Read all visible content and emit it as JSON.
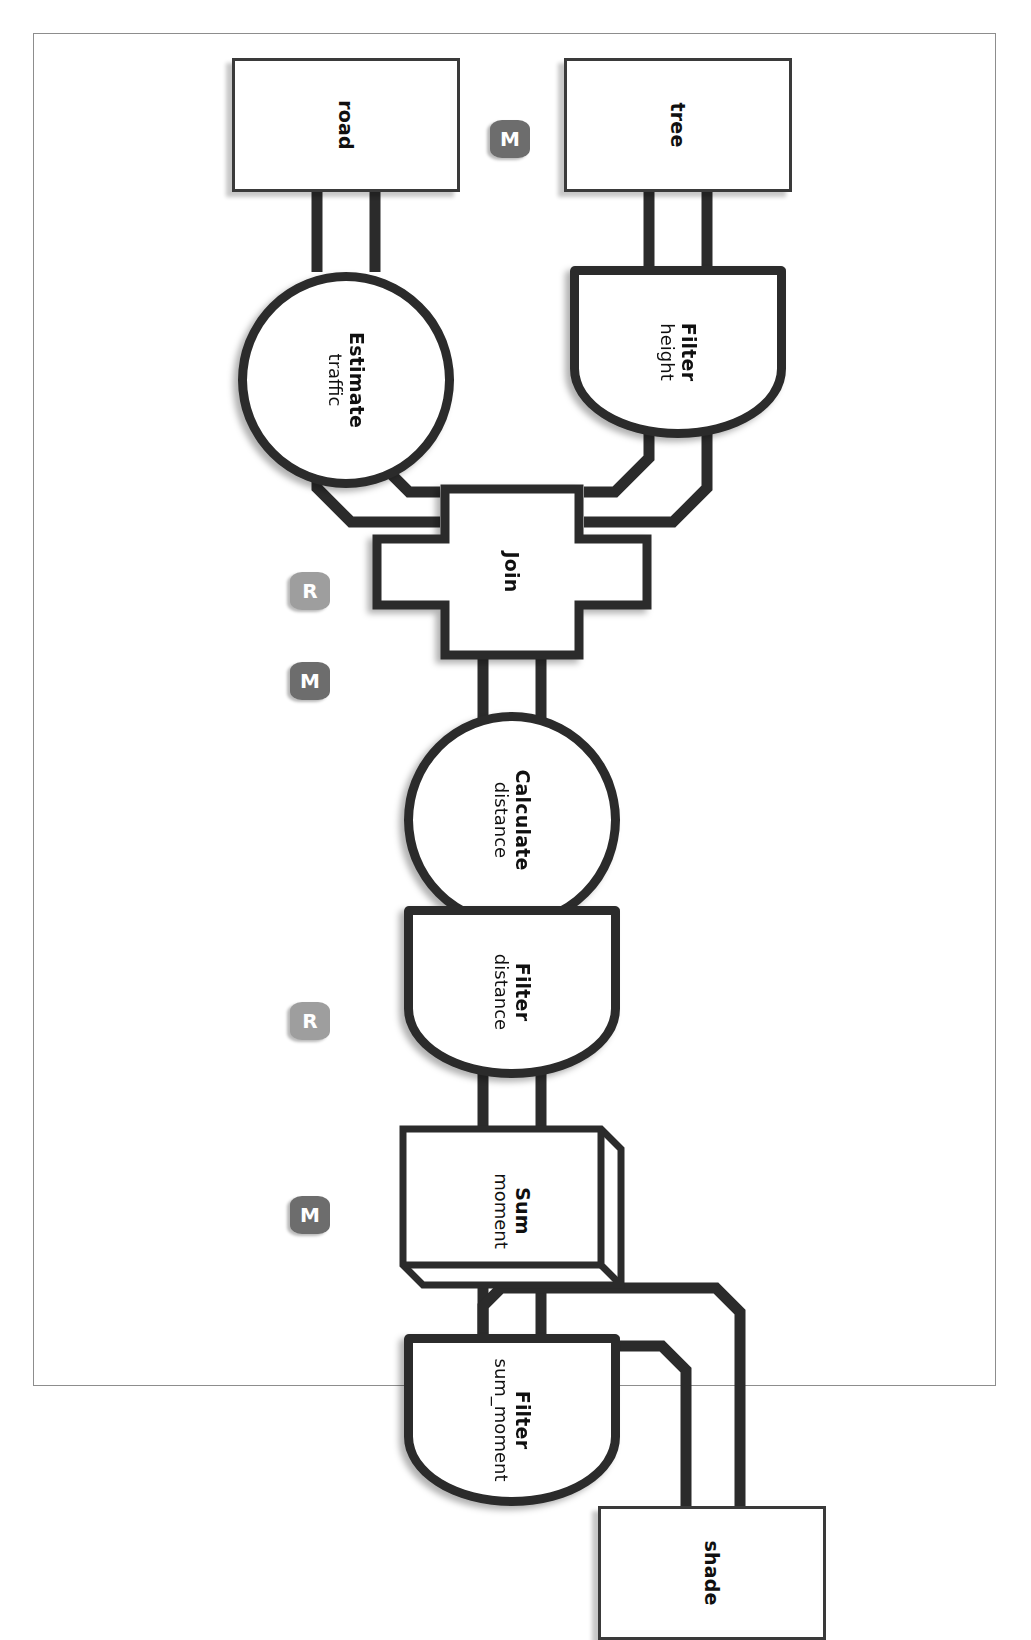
{
  "diagram": {
    "orientation": "rotated-90",
    "colors": {
      "shape_stroke": "#2b2b2b",
      "connector": "#2b2b2b",
      "store_stroke": "#3a3a3a",
      "badge_m": "#6d6d6d",
      "badge_r": "#9e9e9e",
      "page_frame": "#8d8d8d",
      "background": "#ffffff"
    },
    "nodes": [
      {
        "id": "tree",
        "shape": "data-store",
        "title": "tree",
        "subtitle": ""
      },
      {
        "id": "road",
        "shape": "data-store",
        "title": "road",
        "subtitle": ""
      },
      {
        "id": "shade",
        "shape": "data-store",
        "title": "shade",
        "subtitle": ""
      },
      {
        "id": "filter_height",
        "shape": "d-shape",
        "title": "Filter",
        "subtitle": "height"
      },
      {
        "id": "estimate_traffic",
        "shape": "circle",
        "title": "Estimate",
        "subtitle": "traffic"
      },
      {
        "id": "join",
        "shape": "cross",
        "title": "Join",
        "subtitle": ""
      },
      {
        "id": "calculate_distance",
        "shape": "circle",
        "title": "Calculate",
        "subtitle": "distance"
      },
      {
        "id": "filter_distance",
        "shape": "d-shape",
        "title": "Filter",
        "subtitle": "distance"
      },
      {
        "id": "sum_moment",
        "shape": "box-3d",
        "title": "Sum",
        "subtitle": "moment"
      },
      {
        "id": "filter_sum_moment",
        "shape": "d-shape",
        "title": "Filter",
        "subtitle": "sum_moment"
      }
    ],
    "badges": [
      {
        "id": "badge-tree",
        "label": "M",
        "kind": "map"
      },
      {
        "id": "badge-join",
        "label": "R",
        "kind": "reduce"
      },
      {
        "id": "badge-calculate",
        "label": "M",
        "kind": "map"
      },
      {
        "id": "badge-sum",
        "label": "R",
        "kind": "reduce"
      },
      {
        "id": "badge-filter-sum",
        "label": "M",
        "kind": "map"
      }
    ],
    "edges": [
      {
        "from": "tree",
        "to": "filter_height"
      },
      {
        "from": "road",
        "to": "estimate_traffic"
      },
      {
        "from": "filter_height",
        "to": "join"
      },
      {
        "from": "estimate_traffic",
        "to": "join"
      },
      {
        "from": "join",
        "to": "calculate_distance"
      },
      {
        "from": "calculate_distance",
        "to": "filter_distance"
      },
      {
        "from": "filter_distance",
        "to": "sum_moment"
      },
      {
        "from": "sum_moment",
        "to": "filter_sum_moment"
      },
      {
        "from": "filter_sum_moment",
        "to": "shade"
      }
    ]
  }
}
